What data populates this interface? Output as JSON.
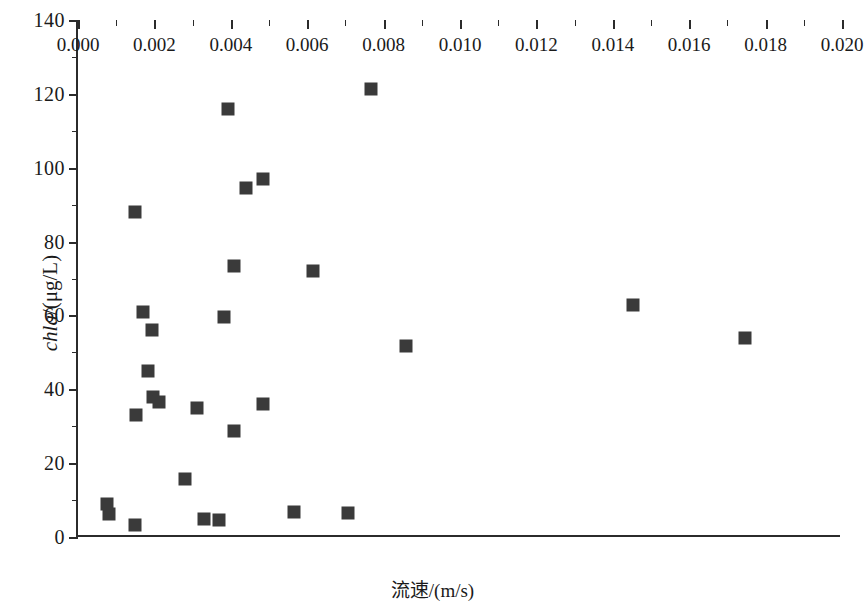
{
  "chart_data": {
    "type": "scatter",
    "title": "",
    "xlabel": "流速/(m/s)",
    "ylabel": "chla/(μg/L)",
    "xlim": [
      0.0,
      0.02
    ],
    "ylim": [
      0,
      140
    ],
    "xticks": [
      0.0,
      0.002,
      0.004,
      0.006,
      0.008,
      0.01,
      0.012,
      0.014,
      0.016,
      0.018,
      0.02
    ],
    "xticklabels": [
      "0.000",
      "0.002",
      "0.004",
      "0.006",
      "0.008",
      "0.010",
      "0.012",
      "0.014",
      "0.016",
      "0.018",
      "0.020"
    ],
    "yticks": [
      0,
      20,
      40,
      60,
      80,
      100,
      120,
      140
    ],
    "yticklabels": [
      "0",
      "20",
      "40",
      "60",
      "80",
      "100",
      "120",
      "140"
    ],
    "x_minor_ticks": [
      0.001,
      0.003,
      0.005,
      0.007,
      0.009,
      0.011,
      0.013,
      0.015,
      0.017,
      0.019
    ],
    "y_minor_ticks": [
      10,
      30,
      50,
      70,
      90,
      110,
      130
    ],
    "grid": false,
    "legend": null,
    "marker": "square",
    "marker_color": "#3a3a3a",
    "marker_size_px": 13,
    "points": [
      {
        "x": 0.00075,
        "y": 9.0
      },
      {
        "x": 0.0008,
        "y": 6.3
      },
      {
        "x": 0.0015,
        "y": 3.2
      },
      {
        "x": 0.00148,
        "y": 88.0
      },
      {
        "x": 0.0017,
        "y": 61.0
      },
      {
        "x": 0.00195,
        "y": 56.0
      },
      {
        "x": 0.00182,
        "y": 45.0
      },
      {
        "x": 0.00197,
        "y": 38.0
      },
      {
        "x": 0.00212,
        "y": 36.5
      },
      {
        "x": 0.00152,
        "y": 33.0
      },
      {
        "x": 0.0028,
        "y": 15.7
      },
      {
        "x": 0.00312,
        "y": 35.0
      },
      {
        "x": 0.0033,
        "y": 5.0
      },
      {
        "x": 0.00368,
        "y": 4.6
      },
      {
        "x": 0.00393,
        "y": 116.0
      },
      {
        "x": 0.00408,
        "y": 73.5
      },
      {
        "x": 0.00382,
        "y": 59.5
      },
      {
        "x": 0.00408,
        "y": 28.8
      },
      {
        "x": 0.0044,
        "y": 94.5
      },
      {
        "x": 0.00485,
        "y": 97.0
      },
      {
        "x": 0.00485,
        "y": 36.0
      },
      {
        "x": 0.00565,
        "y": 6.8
      },
      {
        "x": 0.00615,
        "y": 72.0
      },
      {
        "x": 0.00708,
        "y": 6.5
      },
      {
        "x": 0.00767,
        "y": 121.3
      },
      {
        "x": 0.00858,
        "y": 51.8
      },
      {
        "x": 0.01453,
        "y": 62.8
      },
      {
        "x": 0.01745,
        "y": 53.8
      }
    ]
  }
}
